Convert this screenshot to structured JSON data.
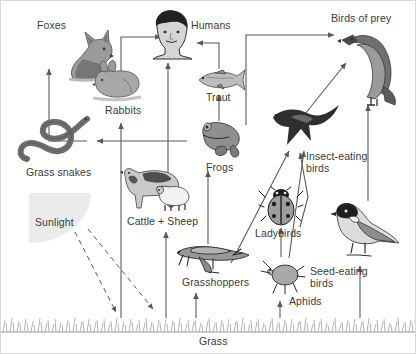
{
  "diagram": {
    "background": "#ffffff",
    "arrow_color": "#5a5a5a",
    "label_color": "#3a3a3a",
    "sun_color": "#ebebeb",
    "width": 416,
    "height": 354
  },
  "nodes": [
    {
      "id": "foxes",
      "label": "Foxes",
      "icon": "fox-icon",
      "x": 36,
      "y": 18
    },
    {
      "id": "humans",
      "label": "Humans",
      "icon": "human-head-icon",
      "x": 190,
      "y": 18
    },
    {
      "id": "birds_of_prey",
      "label": "Birds of prey",
      "icon": "eagle-icon",
      "x": 330,
      "y": 11
    },
    {
      "id": "rabbits",
      "label": "Rabbits",
      "icon": "rabbit-icon",
      "x": 104,
      "y": 103
    },
    {
      "id": "trout",
      "label": "Trout",
      "icon": "trout-icon",
      "x": 205,
      "y": 90
    },
    {
      "id": "grass_snakes",
      "label": "Grass snakes",
      "icon": "snake-icon",
      "x": 25,
      "y": 165
    },
    {
      "id": "frogs",
      "label": "Frogs",
      "icon": "frog-icon",
      "x": 205,
      "y": 160
    },
    {
      "id": "insect_birds",
      "label": "Insect-eating birds",
      "icon": "swallow-icon",
      "x": 305,
      "y": 149
    },
    {
      "id": "cattle_sheep",
      "label": "Cattle + Sheep",
      "icon": "cow-sheep-icon",
      "x": 126,
      "y": 214
    },
    {
      "id": "ladybirds",
      "label": "Ladybirds",
      "icon": "ladybird-icon",
      "x": 254,
      "y": 226
    },
    {
      "id": "sunlight",
      "label": "Sunlight",
      "icon": "sun-icon",
      "x": 34,
      "y": 215
    },
    {
      "id": "grasshoppers",
      "label": "Grasshoppers",
      "icon": "grasshopper-icon",
      "x": 181,
      "y": 275
    },
    {
      "id": "seed_birds",
      "label": "Seed-eating birds",
      "icon": "tit-bird-icon",
      "x": 309,
      "y": 264
    },
    {
      "id": "aphids",
      "label": "Aphids",
      "icon": "aphid-icon",
      "x": 288,
      "y": 294
    },
    {
      "id": "grass",
      "label": "Grass",
      "icon": "grass-icon",
      "x": 198,
      "y": 334
    }
  ],
  "flows": [
    {
      "from": "grass",
      "to": "rabbits"
    },
    {
      "from": "grass",
      "to": "cattle_sheep"
    },
    {
      "from": "grass",
      "to": "grasshoppers"
    },
    {
      "from": "grass",
      "to": "aphids"
    },
    {
      "from": "grass",
      "to": "seed_birds"
    },
    {
      "from": "rabbits",
      "to": "foxes"
    },
    {
      "from": "rabbits",
      "to": "humans"
    },
    {
      "from": "rabbits",
      "to": "grass_snakes"
    },
    {
      "from": "cattle_sheep",
      "to": "humans"
    },
    {
      "from": "trout",
      "to": "humans"
    },
    {
      "from": "frogs",
      "to": "trout"
    },
    {
      "from": "frogs",
      "to": "grass_snakes"
    },
    {
      "from": "frogs",
      "to": "birds_of_prey"
    },
    {
      "from": "grasshoppers",
      "to": "frogs"
    },
    {
      "from": "grasshoppers",
      "to": "insect_birds"
    },
    {
      "from": "aphids",
      "to": "ladybirds"
    },
    {
      "from": "aphids",
      "to": "insect_birds"
    },
    {
      "from": "ladybirds",
      "to": "insect_birds"
    },
    {
      "from": "insect_birds",
      "to": "birds_of_prey"
    },
    {
      "from": "seed_birds",
      "to": "birds_of_prey"
    },
    {
      "from": "sunlight",
      "to": "grass",
      "style": "dashed"
    }
  ]
}
